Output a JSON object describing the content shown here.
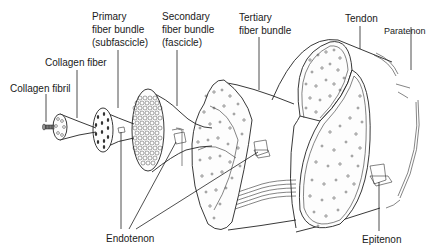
{
  "diagram": {
    "labels": {
      "collagen_fibril": "Collagen fibril",
      "collagen_fiber": "Collagen fiber",
      "primary_bundle": [
        "Primary",
        "fiber bundle",
        "(subfascicle)"
      ],
      "secondary_bundle": [
        "Secondary",
        "fiber bundle",
        "(fascicle)"
      ],
      "tertiary_bundle": [
        "Tertiary",
        "fiber bundle"
      ],
      "tendon": "Tendon",
      "paratenon": "Paratenon",
      "endotenon": "Endotenon",
      "epitenon": "Epitenon"
    },
    "structures": [
      {
        "name": "Collagen fibril",
        "order": 1
      },
      {
        "name": "Collagen fiber",
        "order": 2
      },
      {
        "name": "Primary fiber bundle (subfascicle)",
        "order": 3
      },
      {
        "name": "Secondary fiber bundle (fascicle)",
        "order": 4
      },
      {
        "name": "Tertiary fiber bundle",
        "order": 5
      },
      {
        "name": "Tendon",
        "order": 6
      }
    ],
    "sheaths": [
      "Endotenon",
      "Epitenon",
      "Paratenon"
    ],
    "colors": {
      "line": "#222222",
      "background": "#ffffff",
      "text": "#1a1a1a"
    }
  }
}
